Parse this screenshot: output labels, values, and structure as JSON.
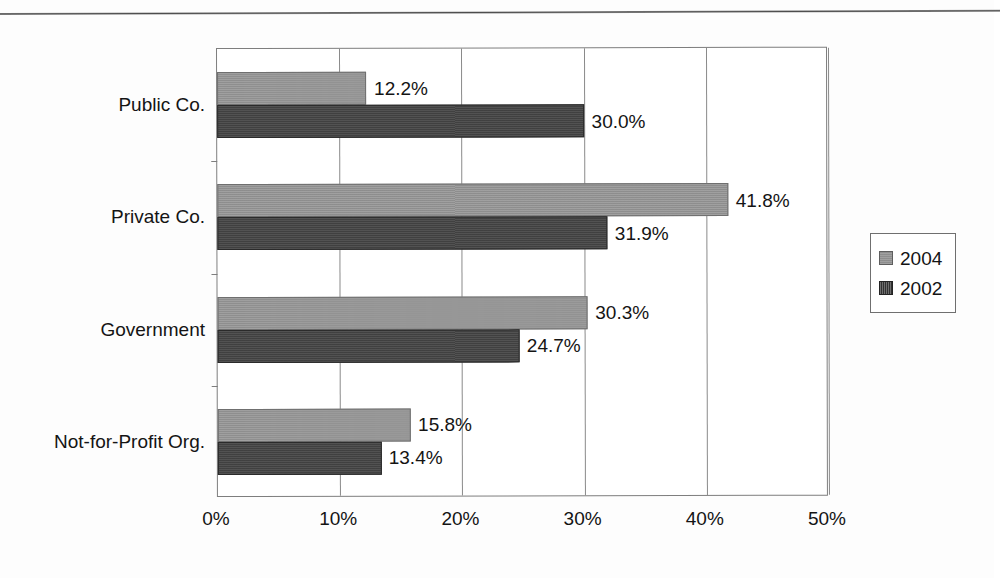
{
  "chart_data": {
    "type": "bar",
    "orientation": "horizontal",
    "title": "",
    "xlabel": "",
    "ylabel": "",
    "categories": [
      "Public Co.",
      "Private Co.",
      "Government",
      "Not-for-Profit Org."
    ],
    "series": [
      {
        "name": "2004",
        "color": "#959595",
        "values": [
          12.2,
          41.8,
          30.3,
          15.8
        ],
        "labels": [
          "12.2%",
          "41.8%",
          "30.3%",
          "15.8%"
        ]
      },
      {
        "name": "2002",
        "color": "#454545",
        "values": [
          30.0,
          31.9,
          24.7,
          13.4
        ],
        "labels": [
          "30.0%",
          "31.9%",
          "24.7%",
          "13.4%"
        ]
      }
    ],
    "xlim": [
      0,
      50
    ],
    "xticks": [
      0,
      10,
      20,
      30,
      40,
      50
    ],
    "xtick_labels": [
      "0%",
      "10%",
      "20%",
      "30%",
      "40%",
      "50%"
    ],
    "grid": true,
    "grid_axis": "x",
    "legend_position": "right",
    "legend_entries": [
      "2004",
      "2002"
    ]
  },
  "legend": {
    "items": [
      {
        "label": "2004",
        "swatch": "legend-swatch-2004"
      },
      {
        "label": "2002",
        "swatch": "legend-swatch-2002"
      }
    ]
  },
  "decorations": {
    "top_rule": "horizontal-rule"
  }
}
